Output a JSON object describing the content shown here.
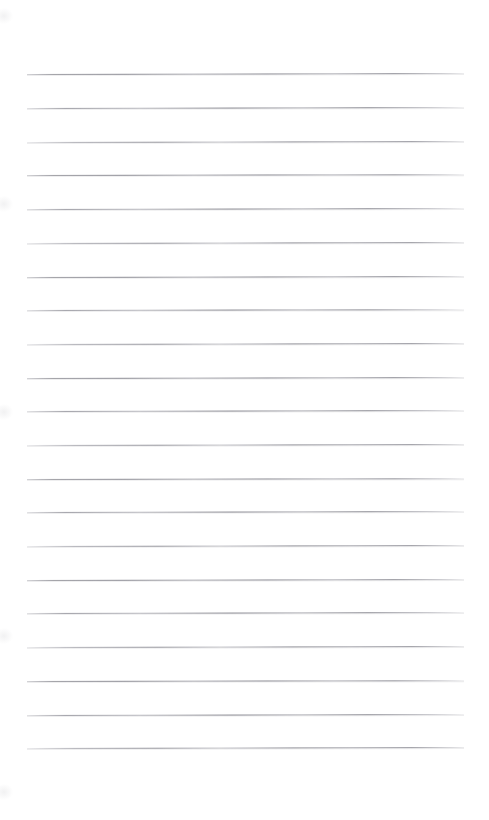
{
  "document": {
    "kind": "scanned-ruled-paper",
    "title": "Blank lined notebook page",
    "page_width": 489,
    "page_height": 820,
    "background_color": "#ffffff",
    "has_text_content": false,
    "has_handwriting": false,
    "has_margin_rule": false,
    "notes": "Empty ruled writing sheet; no headers, page numbers, captions or marks other than the horizontal rules."
  },
  "ruling": {
    "line_color": "#8d8d95",
    "line_opacity_label": "faint",
    "line_thickness_px": 1,
    "line_count": 21,
    "line_left_px": 27,
    "line_right_px": 464,
    "line_length_px": 437,
    "first_line_y_px": 74,
    "last_line_y_px": 748,
    "line_spacing_px": 33.7,
    "top_margin_px": 74,
    "bottom_margin_px": 72,
    "left_margin_px": 27,
    "right_margin_px": 25,
    "scan_tilt_deg": -0.12,
    "lines": [
      {
        "index": 1,
        "y": 74,
        "tilt_deg": -0.14,
        "density": "v1"
      },
      {
        "index": 2,
        "y": 108,
        "tilt_deg": -0.12,
        "density": "v2"
      },
      {
        "index": 3,
        "y": 142,
        "tilt_deg": -0.13,
        "density": "v3"
      },
      {
        "index": 4,
        "y": 175,
        "tilt_deg": -0.11,
        "density": "v1"
      },
      {
        "index": 5,
        "y": 209,
        "tilt_deg": -0.13,
        "density": "v2"
      },
      {
        "index": 6,
        "y": 243,
        "tilt_deg": -0.12,
        "density": "v3"
      },
      {
        "index": 7,
        "y": 277,
        "tilt_deg": -0.14,
        "density": "v1"
      },
      {
        "index": 8,
        "y": 310,
        "tilt_deg": -0.11,
        "density": "v2"
      },
      {
        "index": 9,
        "y": 344,
        "tilt_deg": -0.13,
        "density": "v3"
      },
      {
        "index": 10,
        "y": 378,
        "tilt_deg": -0.12,
        "density": "v1"
      },
      {
        "index": 11,
        "y": 411,
        "tilt_deg": -0.14,
        "density": "v2"
      },
      {
        "index": 12,
        "y": 445,
        "tilt_deg": -0.12,
        "density": "v3"
      },
      {
        "index": 13,
        "y": 479,
        "tilt_deg": -0.11,
        "density": "v1"
      },
      {
        "index": 14,
        "y": 512,
        "tilt_deg": -0.13,
        "density": "v2"
      },
      {
        "index": 15,
        "y": 546,
        "tilt_deg": -0.12,
        "density": "v3"
      },
      {
        "index": 16,
        "y": 580,
        "tilt_deg": -0.14,
        "density": "v1"
      },
      {
        "index": 17,
        "y": 613,
        "tilt_deg": -0.12,
        "density": "v2"
      },
      {
        "index": 18,
        "y": 647,
        "tilt_deg": -0.13,
        "density": "v3"
      },
      {
        "index": 19,
        "y": 681,
        "tilt_deg": -0.11,
        "density": "v1"
      },
      {
        "index": 20,
        "y": 715,
        "tilt_deg": -0.13,
        "density": "v2"
      },
      {
        "index": 21,
        "y": 748,
        "tilt_deg": -0.12,
        "density": "v3"
      }
    ]
  },
  "artifacts": {
    "edge_smudges": [
      {
        "y": 8
      },
      {
        "y": 196
      },
      {
        "y": 404
      },
      {
        "y": 628
      },
      {
        "y": 784
      }
    ]
  }
}
